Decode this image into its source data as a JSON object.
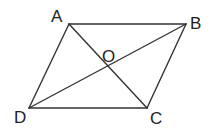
{
  "diagram": {
    "type": "parallelogram-with-diagonals",
    "points": {
      "A": {
        "label": "A",
        "x": 69,
        "y": 24
      },
      "B": {
        "label": "B",
        "x": 186,
        "y": 24
      },
      "C": {
        "label": "C",
        "x": 147,
        "y": 108
      },
      "D": {
        "label": "D",
        "x": 29,
        "y": 108
      },
      "O": {
        "label": "O",
        "x": 107,
        "y": 66
      }
    },
    "segments": [
      "AB",
      "BC",
      "CD",
      "DA",
      "AC",
      "BD"
    ],
    "stroke_color": "#333333"
  }
}
